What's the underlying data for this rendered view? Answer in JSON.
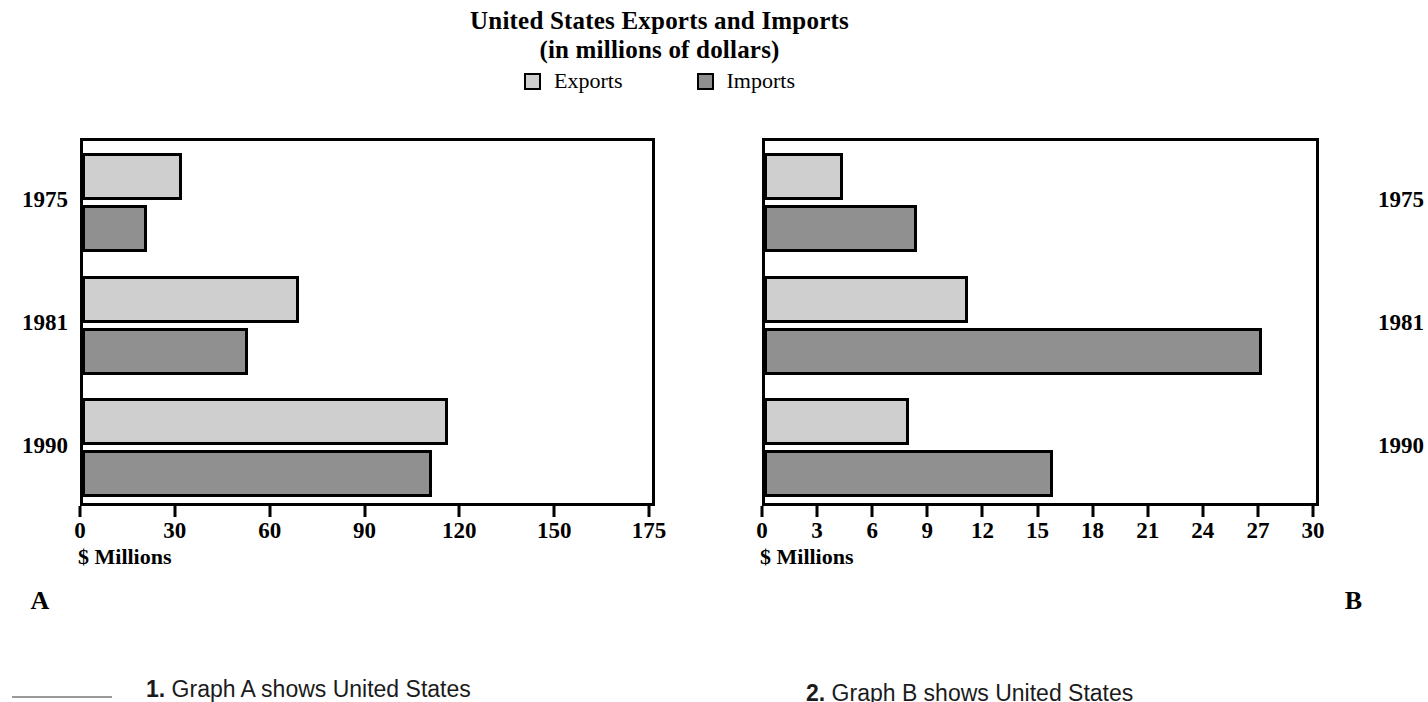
{
  "title": {
    "line1": "United States Exports and Imports",
    "line2": "(in millions of dollars)"
  },
  "legend": {
    "items": [
      {
        "label": "Exports",
        "color": "#cfcfcf",
        "swatch_icon": "legend-swatch-icon"
      },
      {
        "label": "Imports",
        "color": "#909090",
        "swatch_icon": "legend-swatch-icon"
      }
    ]
  },
  "panels": [
    {
      "letter": "A",
      "axis_title": "$ Millions"
    },
    {
      "letter": "B",
      "axis_title": "$ Millions"
    }
  ],
  "questions": {
    "blank_label": "answer-blank",
    "items": [
      {
        "number": "1.",
        "text": "Graph A shows United States"
      },
      {
        "number": "2.",
        "text": "Graph B shows United States"
      }
    ]
  },
  "chart_data": [
    {
      "id": "A",
      "type": "bar",
      "orientation": "horizontal",
      "title": "United States Exports and Imports (in millions of dollars)",
      "panel_label": "A",
      "xlabel": "$ Millions",
      "ylabel": "",
      "categories": [
        "1975",
        "1981",
        "1990"
      ],
      "series": [
        {
          "name": "Exports",
          "color": "#cfcfcf",
          "values": [
            31,
            68,
            115
          ]
        },
        {
          "name": "Imports",
          "color": "#909090",
          "values": [
            20,
            52,
            110
          ]
        }
      ],
      "xticks": [
        0,
        30,
        60,
        90,
        120,
        150,
        175
      ],
      "xticklabels": [
        "0",
        "30",
        "60",
        "90",
        "120",
        "150",
        "175"
      ],
      "xlim": [
        0,
        175
      ],
      "grid": false,
      "legend_position": "top-center",
      "note": "Final tick interval is 25 rather than 30 but ticks are drawn evenly spaced."
    },
    {
      "id": "B",
      "type": "bar",
      "orientation": "horizontal",
      "title": "United States Exports and Imports (in millions of dollars)",
      "panel_label": "B",
      "xlabel": "$ Millions",
      "ylabel": "",
      "categories": [
        "1975",
        "1981",
        "1990"
      ],
      "series": [
        {
          "name": "Exports",
          "color": "#cfcfcf",
          "values": [
            4.2,
            11,
            7.8
          ]
        },
        {
          "name": "Imports",
          "color": "#909090",
          "values": [
            8.2,
            27,
            15.6
          ]
        }
      ],
      "xticks": [
        0,
        3,
        6,
        9,
        12,
        15,
        18,
        21,
        24,
        27,
        30
      ],
      "xticklabels": [
        "0",
        "3",
        "6",
        "9",
        "12",
        "15",
        "18",
        "21",
        "24",
        "27",
        "30"
      ],
      "xlim": [
        0,
        30
      ],
      "grid": false,
      "legend_position": "top-center"
    }
  ]
}
